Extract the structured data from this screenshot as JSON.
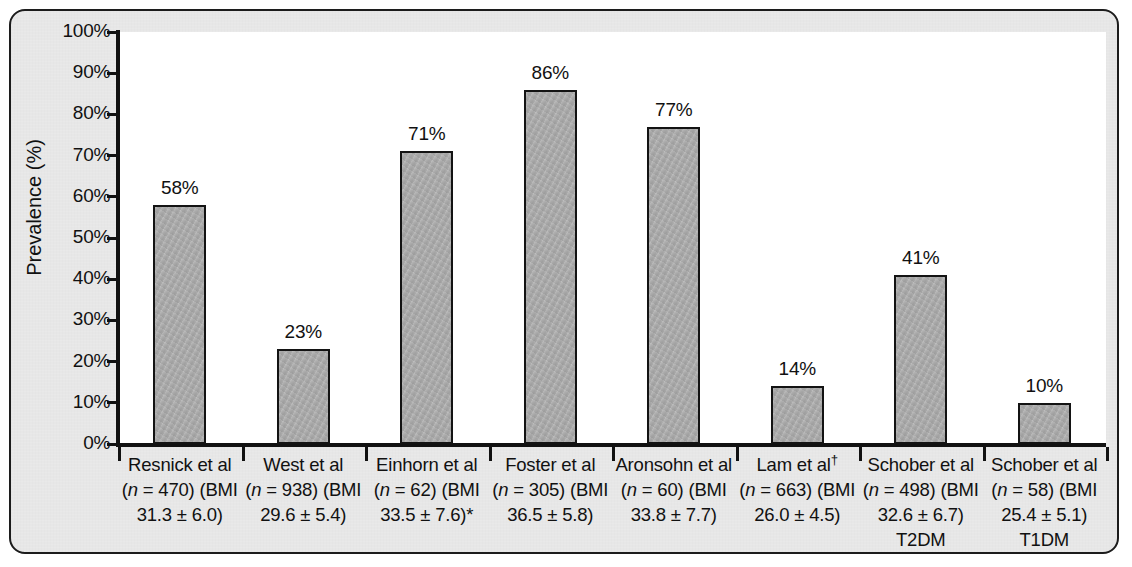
{
  "figure": {
    "y_axis_title": "Prevalence (%)",
    "frame_color": "#1c1c1c",
    "page_background": "#e9e9e9",
    "plot_background": "#ffffff",
    "bar_fill_color": "#ababab",
    "bar_border_color": "#131313"
  },
  "chart_data": {
    "type": "bar",
    "title": "",
    "xlabel": "",
    "ylabel": "Prevalence (%)",
    "ylim": [
      0,
      100
    ],
    "grid": false,
    "legend": "none",
    "ytick_labels": [
      "100%",
      "90%",
      "80%",
      "70%",
      "60%",
      "50%",
      "40%",
      "30%",
      "20%",
      "10%",
      "0%"
    ],
    "ytick_values": [
      100,
      90,
      80,
      70,
      60,
      50,
      40,
      30,
      20,
      10,
      0
    ],
    "categories": [
      "Resnick et al (n = 470) (BMI 31.3 ± 6.0)",
      "West et al (n = 938) (BMI 29.6 ± 5.4)",
      "Einhorn et al (n = 62) (BMI 33.5 ± 7.6)*",
      "Foster et al (n = 305) (BMI 36.5 ± 5.8)",
      "Aronsohn et al (n = 60) (BMI 33.8 ± 7.7)",
      "Lam et al† (n = 663) (BMI 26.0 ± 4.5)",
      "Schober et al (n = 498) (BMI 32.6 ± 6.7) T2DM",
      "Schober et al (n = 58) (BMI 25.4 ± 5.1) T1DM"
    ],
    "values": [
      58,
      23,
      71,
      86,
      77,
      14,
      41,
      10
    ],
    "value_labels": [
      "58%",
      "23%",
      "71%",
      "86%",
      "77%",
      "14%",
      "41%",
      "10%"
    ]
  },
  "studies": [
    {
      "author": "Resnick et al",
      "n": "470",
      "bmi": "31.3 ± 6.0",
      "marker": "",
      "subtype": "",
      "value_label": "58%",
      "line1": "Resnick et al",
      "line2_pre": "(",
      "line2_n": "n",
      "line2_post": " = 470) (BMI",
      "line3": "31.3 ± 6.0)"
    },
    {
      "author": "West et al",
      "n": "938",
      "bmi": "29.6 ± 5.4",
      "marker": "",
      "subtype": "",
      "value_label": "23%",
      "line1": "West et al",
      "line2_pre": "(",
      "line2_n": "n",
      "line2_post": " = 938) (BMI",
      "line3": "29.6 ± 5.4)"
    },
    {
      "author": "Einhorn et al",
      "n": "62",
      "bmi": "33.5 ± 7.6",
      "marker": "*",
      "subtype": "",
      "value_label": "71%",
      "line1": "Einhorn et al",
      "line2_pre": "(",
      "line2_n": "n",
      "line2_post": " = 62) (BMI",
      "line3": "33.5 ± 7.6)*"
    },
    {
      "author": "Foster et al",
      "n": "305",
      "bmi": "36.5 ± 5.8",
      "marker": "",
      "subtype": "",
      "value_label": "86%",
      "line1": "Foster et al",
      "line2_pre": "(",
      "line2_n": "n",
      "line2_post": " = 305) (BMI",
      "line3": "36.5 ± 5.8)"
    },
    {
      "author": "Aronsohn et al",
      "n": "60",
      "bmi": "33.8 ± 7.7",
      "marker": "",
      "subtype": "",
      "value_label": "77%",
      "line1": "Aronsohn et al",
      "line2_pre": "(",
      "line2_n": "n",
      "line2_post": " = 60) (BMI",
      "line3": "33.8 ± 7.7)"
    },
    {
      "author": "Lam et al",
      "n": "663",
      "bmi": "26.0 ± 4.5",
      "marker": "†",
      "subtype": "",
      "value_label": "14%",
      "line1": "Lam et al",
      "line2_pre": "(",
      "line2_n": "n",
      "line2_post": " = 663) (BMI",
      "line3": "26.0 ± 4.5)"
    },
    {
      "author": "Schober et al",
      "n": "498",
      "bmi": "32.6 ± 6.7",
      "marker": "",
      "subtype": "T2DM",
      "value_label": "41%",
      "line1": "Schober et al",
      "line2_pre": "(",
      "line2_n": "n",
      "line2_post": " = 498) (BMI",
      "line3": "32.6 ± 6.7)"
    },
    {
      "author": "Schober et al",
      "n": "58",
      "bmi": "25.4 ± 5.1",
      "marker": "",
      "subtype": "T1DM",
      "value_label": "10%",
      "line1": "Schober et al",
      "line2_pre": "(",
      "line2_n": "n",
      "line2_post": " = 58) (BMI",
      "line3": "25.4 ± 5.1)"
    }
  ]
}
